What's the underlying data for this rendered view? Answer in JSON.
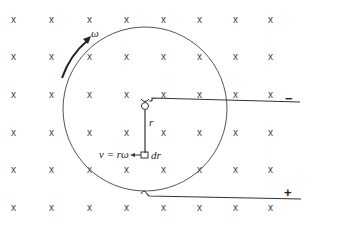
{
  "diagram": {
    "field_symbol": "x",
    "field_grid": {
      "columns": 8,
      "rows": 6
    },
    "labels": {
      "omega": "ω",
      "radius": "r",
      "velocity": "v = rω",
      "element": "dr",
      "negative_terminal": "−",
      "positive_terminal": "+"
    },
    "colors": {
      "ink": "#444444",
      "background": "#ffffff"
    }
  }
}
